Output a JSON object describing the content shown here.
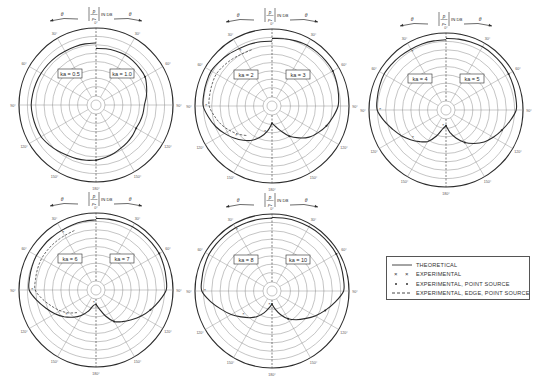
{
  "chart_data": {
    "type": "polar",
    "radial_label": "|p/p0| IN DB",
    "angle_label_left": "θ",
    "angle_label_right": "θ",
    "angle_ticks": [
      "0°",
      "30°",
      "60°",
      "90°",
      "120°",
      "150°",
      "180°"
    ],
    "grid": true,
    "rings": 8,
    "plots": [
      {
        "id": "plot-1",
        "center": [
          96,
          105
        ],
        "left_label": "ka = 0.5",
        "right_label": "ka = 1.0",
        "theoretical_left": [
          [
            0,
            0.78
          ],
          [
            30,
            0.78
          ],
          [
            60,
            0.8
          ],
          [
            90,
            0.82
          ],
          [
            120,
            0.8
          ],
          [
            150,
            0.72
          ],
          [
            180,
            0.68
          ]
        ],
        "theoretical_right": [
          [
            0,
            0.7
          ],
          [
            30,
            0.72
          ],
          [
            60,
            0.7
          ],
          [
            90,
            0.58
          ],
          [
            120,
            0.55
          ],
          [
            150,
            0.6
          ],
          [
            180,
            0.68
          ]
        ]
      },
      {
        "id": "plot-2",
        "center": [
          272,
          106
        ],
        "left_label": "ka = 2",
        "right_label": "ka = 3",
        "theoretical_left": [
          [
            0,
            0.82
          ],
          [
            30,
            0.84
          ],
          [
            60,
            0.9
          ],
          [
            90,
            0.88
          ],
          [
            110,
            0.75
          ],
          [
            130,
            0.6
          ],
          [
            150,
            0.45
          ],
          [
            165,
            0.3
          ],
          [
            180,
            0.12
          ]
        ],
        "theoretical_right": [
          [
            0,
            0.86
          ],
          [
            30,
            0.9
          ],
          [
            60,
            0.9
          ],
          [
            90,
            0.84
          ],
          [
            110,
            0.72
          ],
          [
            130,
            0.58
          ],
          [
            150,
            0.38
          ],
          [
            165,
            0.2
          ],
          [
            180,
            0.12
          ]
        ]
      },
      {
        "id": "plot-3",
        "center": [
          446,
          110
        ],
        "left_label": "ka = 4",
        "right_label": "ka = 5",
        "theoretical_left": [
          [
            0,
            0.9
          ],
          [
            30,
            0.9
          ],
          [
            60,
            0.92
          ],
          [
            90,
            0.88
          ],
          [
            110,
            0.7
          ],
          [
            130,
            0.55
          ],
          [
            150,
            0.4
          ],
          [
            170,
            0.15
          ],
          [
            180,
            0.1
          ]
        ],
        "theoretical_right": [
          [
            0,
            0.92
          ],
          [
            30,
            0.94
          ],
          [
            60,
            0.93
          ],
          [
            90,
            0.9
          ],
          [
            110,
            0.74
          ],
          [
            130,
            0.6
          ],
          [
            150,
            0.42
          ],
          [
            170,
            0.2
          ],
          [
            180,
            0.1
          ]
        ]
      },
      {
        "id": "plot-4",
        "center": [
          96,
          290
        ],
        "left_label": "ka = 6",
        "right_label": "ka = 7",
        "theoretical_left": [
          [
            0,
            0.9
          ],
          [
            30,
            0.88
          ],
          [
            60,
            0.88
          ],
          [
            90,
            0.85
          ],
          [
            110,
            0.65
          ],
          [
            130,
            0.48
          ],
          [
            150,
            0.3
          ],
          [
            170,
            0.1
          ],
          [
            180,
            0.08
          ]
        ],
        "theoretical_right": [
          [
            0,
            0.92
          ],
          [
            30,
            0.94
          ],
          [
            60,
            0.94
          ],
          [
            90,
            0.9
          ],
          [
            110,
            0.72
          ],
          [
            130,
            0.55
          ],
          [
            150,
            0.4
          ],
          [
            170,
            0.15
          ],
          [
            180,
            0.08
          ]
        ]
      },
      {
        "id": "plot-5",
        "center": [
          272,
          291
        ],
        "left_label": "ka = 8",
        "right_label": "ka = 10",
        "theoretical_left": [
          [
            0,
            0.94
          ],
          [
            30,
            0.94
          ],
          [
            60,
            0.94
          ],
          [
            90,
            0.9
          ],
          [
            110,
            0.66
          ],
          [
            130,
            0.46
          ],
          [
            150,
            0.3
          ],
          [
            170,
            0.12
          ],
          [
            180,
            0.06
          ]
        ],
        "theoretical_right": [
          [
            0,
            0.95
          ],
          [
            30,
            0.96
          ],
          [
            60,
            0.96
          ],
          [
            90,
            0.92
          ],
          [
            110,
            0.7
          ],
          [
            130,
            0.5
          ],
          [
            150,
            0.34
          ],
          [
            170,
            0.14
          ],
          [
            180,
            0.06
          ]
        ]
      }
    ],
    "legend": [
      {
        "label": "THEORETICAL",
        "style": "solid"
      },
      {
        "label": "EXPERIMENTAL",
        "style": "cross"
      },
      {
        "label": "EXPERIMENTAL, POINT SOURCE",
        "style": "circle"
      },
      {
        "label": "EXPERIMENTAL, EDGE, POINT SOURCE",
        "style": "dashed"
      }
    ]
  },
  "legend": {
    "items": [
      {
        "label": "THEORETICAL"
      },
      {
        "label": "EXPERIMENTAL"
      },
      {
        "label": "EXPERIMENTAL, POINT SOURCE"
      },
      {
        "label": "EXPERIMENTAL, EDGE, POINT SOURCE"
      }
    ]
  },
  "colors": {
    "ink": "#2b2b2b",
    "grid": "#8a8a8a",
    "paper": "#ffffff"
  }
}
